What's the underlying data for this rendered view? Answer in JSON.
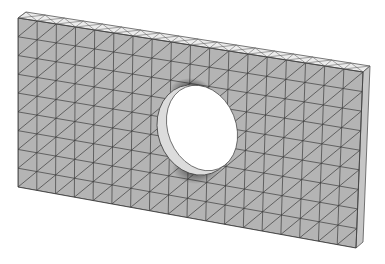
{
  "figure": {
    "colors": {
      "background": "#ffffff",
      "front_face": "#b4b4b4",
      "top_face": "#ececec",
      "side_face": "#c6c6c6",
      "mesh_lines": "#3a3a3a",
      "hole": "#ffffff",
      "refinement_shadow": "#2e2e2e"
    }
  }
}
